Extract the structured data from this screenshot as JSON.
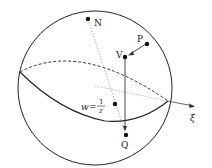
{
  "diagram": {
    "type": "riemann-sphere-projection",
    "points": {
      "N": {
        "label": "N",
        "x": 88,
        "y": 19
      },
      "P": {
        "label": "P",
        "x": 147,
        "y": 44
      },
      "V": {
        "label": "V",
        "x": 125,
        "y": 57
      },
      "w": {
        "label_lhs": "w",
        "label_eq": "=",
        "label_num": "1",
        "label_den": "z",
        "x": 115,
        "y": 104
      },
      "Q": {
        "label": "Q",
        "x": 126,
        "y": 135
      }
    },
    "axis": {
      "label": "ξ"
    },
    "colors": {
      "stroke": "#222222",
      "dashed": "#555555",
      "dotted": "#999999"
    }
  }
}
